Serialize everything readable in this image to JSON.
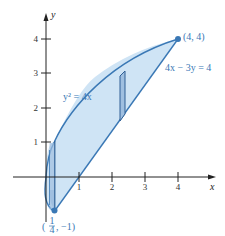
{
  "figure": {
    "axes": {
      "x_label": "x",
      "y_label": "y",
      "x_ticks": [
        "1",
        "2",
        "3",
        "4"
      ],
      "y_ticks": [
        "1",
        "2",
        "3",
        "4"
      ]
    },
    "curves": {
      "parabola_label": "y² = 4x",
      "line_label": "4x − 3y = 4"
    },
    "points": {
      "upper": {
        "label": "(4, 4)",
        "x": 4,
        "y": 4
      },
      "lower": {
        "label_open": "(",
        "num": "1",
        "den": "4",
        "label_rest": ", −1)",
        "x": 0.25,
        "y": -1
      }
    },
    "colors": {
      "fill": "#cfe4f5",
      "stroke": "#3a78b5",
      "strip_fill": "#9fbfe0",
      "axis": "#222222"
    }
  }
}
